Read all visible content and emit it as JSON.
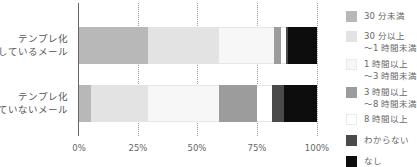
{
  "chart_data": {
    "type": "bar",
    "orientation": "horizontal",
    "stacked": true,
    "percent": true,
    "title": "",
    "xlabel": "",
    "ylabel": "",
    "xlim": [
      0,
      100
    ],
    "x_ticks": [
      "0%",
      "25%",
      "50%",
      "75%",
      "100%"
    ],
    "grid": "vertical dotted",
    "legend_position": "right",
    "categories": [
      {
        "line1": "テンプレ化",
        "line2": "しているメール"
      },
      {
        "line1": "テンプレ化",
        "line2": "していないメール"
      }
    ],
    "series": [
      {
        "name": "30 分未満",
        "line1": "30 分未満",
        "line2": "",
        "color": "#b8b8b8",
        "values": [
          29,
          5
        ]
      },
      {
        "name": "30 分以上〜1 時間未満",
        "line1": "30 分以上",
        "line2": "〜1 時間未満",
        "color": "#e3e3e3",
        "values": [
          30,
          24
        ]
      },
      {
        "name": "1 時間以上〜3 時間未満",
        "line1": "1 時間以上",
        "line2": "〜3 時間未満",
        "color": "#f7f7f7",
        "values": [
          23,
          30
        ]
      },
      {
        "name": "3 時間以上〜8 時間未満",
        "line1": "3 時間以上",
        "line2": "〜8 時間未満",
        "color": "#9c9c9c",
        "values": [
          3,
          16
        ]
      },
      {
        "name": "8 時間以上",
        "line1": "8 時間以上",
        "line2": "",
        "color": "#ffffff",
        "values": [
          2,
          6
        ]
      },
      {
        "name": "わからない",
        "line1": "わからない",
        "line2": "",
        "color": "#4a4a4a",
        "values": [
          1,
          5
        ]
      },
      {
        "name": "なし",
        "line1": "なし",
        "line2": "",
        "color": "#0d0d0d",
        "values": [
          12,
          14
        ]
      }
    ]
  }
}
